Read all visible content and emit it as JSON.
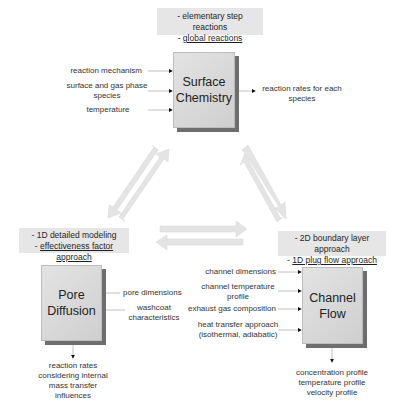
{
  "surface_chemistry": {
    "title_line1": "Surface",
    "title_line2": "Chemistry",
    "approaches": {
      "line1": "- elementary step reactions",
      "line2_prefix": "- ",
      "line2": "global reactions"
    },
    "inputs": [
      {
        "line1": "reaction mechanism",
        "line2": ""
      },
      {
        "line1": "surface and gas phase",
        "line2": "species"
      },
      {
        "line1": "temperature",
        "line2": ""
      }
    ],
    "output": {
      "line1": "reaction rates for each",
      "line2": "species"
    }
  },
  "pore_diffusion": {
    "title_line1": "Pore",
    "title_line2": "Diffusion",
    "approaches": {
      "line1": "- 1D detailed modeling",
      "line2_prefix": "- ",
      "line2": "effectiveness factor approach"
    },
    "inputs": [
      {
        "line1": "pore dimensions",
        "line2": ""
      },
      {
        "line1": "washcoat",
        "line2": "characteristics"
      }
    ],
    "output": {
      "line1": "reaction rates",
      "line2": "considering internal",
      "line3": "mass transfer",
      "line4": "influences"
    }
  },
  "channel_flow": {
    "title_line1": "Channel",
    "title_line2": "Flow",
    "approaches": {
      "line1": "- 2D boundary layer approach",
      "line2_prefix": "- ",
      "line2": "1D plug flow approach"
    },
    "inputs": [
      {
        "line1": "channel dimensions",
        "line2": ""
      },
      {
        "line1": "channel temperature",
        "line2": "profile"
      },
      {
        "line1": "exhaust gas composition",
        "line2": ""
      },
      {
        "line1": "heat transfer approach",
        "line2": "(isothermal, adiabatic)"
      }
    ],
    "output": {
      "line1": "concentration profile",
      "line2": "temperature profile",
      "line3": "velocity profile"
    }
  },
  "colors": {
    "label_box_bg": "#e6e6e6",
    "block_fill": "#d9d9d9",
    "block_shadow": "#6e6e6e",
    "coupling_arrow": "#e2e2e2",
    "line_color": "#9a9a9a",
    "arrowhead": "#111111"
  }
}
